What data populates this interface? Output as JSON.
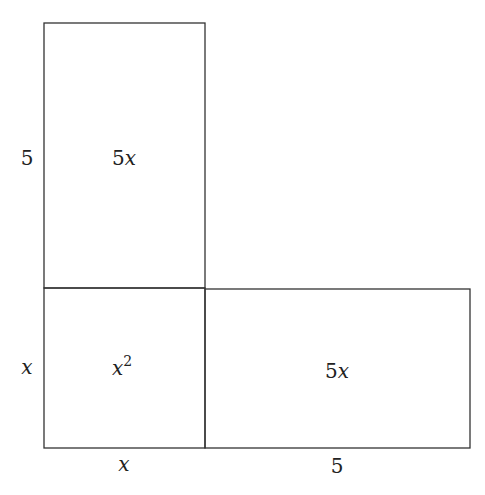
{
  "diagram": {
    "type": "area-model",
    "stroke_color": "#333333",
    "regions": [
      {
        "id": "top",
        "label_coef": "5",
        "label_var": "x",
        "width": "x",
        "height": "5"
      },
      {
        "id": "square",
        "label_var": "x",
        "label_exp": "2",
        "width": "x",
        "height": "x"
      },
      {
        "id": "right",
        "label_coef": "5",
        "label_var": "x",
        "width": "5",
        "height": "x"
      }
    ],
    "side_labels": {
      "left_top": "5",
      "left_bottom": "x",
      "bottom_left": "x",
      "bottom_right": "5"
    }
  }
}
